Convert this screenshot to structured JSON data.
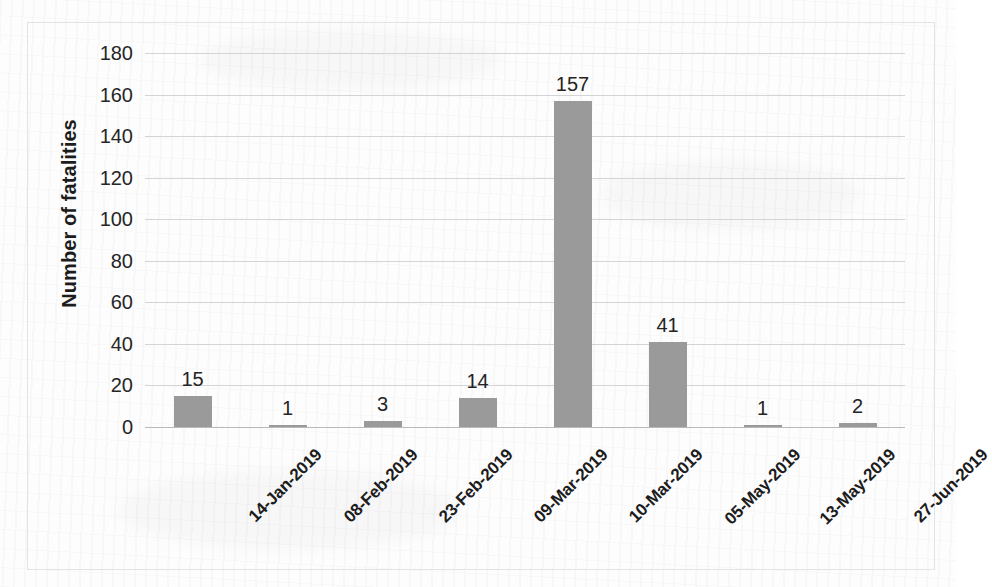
{
  "chart_data": {
    "type": "bar",
    "title": "",
    "xlabel": "",
    "ylabel": "Number of fatalities",
    "categories": [
      "14-Jan-2019",
      "08-Feb-2019",
      "23-Feb-2019",
      "09-Mar-2019",
      "10-Mar-2019",
      "05-May-2019",
      "13-May-2019",
      "27-Jun-2019"
    ],
    "values": [
      15,
      1,
      3,
      14,
      157,
      41,
      1,
      2
    ],
    "data_labels": [
      "15",
      "1",
      "3",
      "14",
      "157",
      "41",
      "1",
      "2"
    ],
    "ylim": [
      0,
      180
    ],
    "ytick_labels": [
      "180",
      "160",
      "140",
      "120",
      "100",
      "80",
      "60",
      "40",
      "20",
      "0"
    ],
    "ytick_values": [
      180,
      160,
      140,
      120,
      100,
      80,
      60,
      40,
      20,
      0
    ],
    "grid": true,
    "legend": false,
    "bar_color": "#9a9a9a",
    "gridline_color": "#d4d4d6",
    "text_color": "#1c1c1c",
    "background_color": "#fdfdfd"
  }
}
